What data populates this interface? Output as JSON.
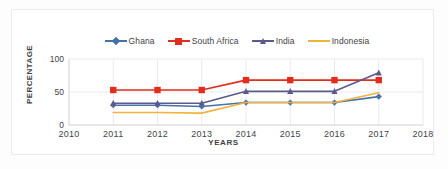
{
  "chart_data": {
    "type": "line",
    "title": "",
    "subtitle": "",
    "xlabel": "YEARS",
    "ylabel": "PERCENTAGE",
    "x": [
      2011,
      2012,
      2013,
      2014,
      2015,
      2016,
      2017
    ],
    "xlim": [
      2010,
      2018
    ],
    "ylim": [
      0,
      100
    ],
    "yticks": [
      0,
      50,
      100
    ],
    "xticks": [
      2010,
      2011,
      2012,
      2013,
      2014,
      2015,
      2016,
      2017,
      2018
    ],
    "grid": "horizontal-and-vertical-light",
    "legend_position": "top-center",
    "series": [
      {
        "name": "Ghana",
        "color": "#4472a8",
        "marker": "diamond",
        "values": [
          30,
          30,
          28,
          34,
          34,
          34,
          43
        ]
      },
      {
        "name": "South Africa",
        "color": "#e32d1c",
        "marker": "square",
        "values": [
          53,
          53,
          53,
          68,
          68,
          68,
          68
        ]
      },
      {
        "name": "India",
        "color": "#5a5a8c",
        "marker": "triangle",
        "values": [
          33,
          33,
          33,
          51,
          51,
          51,
          79
        ]
      },
      {
        "name": "Indonesia",
        "color": "#f2b33d",
        "marker": "none",
        "values": [
          19,
          19,
          18,
          34,
          34,
          34,
          49
        ]
      }
    ]
  },
  "axis": {
    "ytick_labels": [
      "100",
      "50",
      "0"
    ],
    "xtick_labels": [
      "2010",
      "2011",
      "2012",
      "2013",
      "2014",
      "2015",
      "2016",
      "2017",
      "2018"
    ],
    "ylabel": "PERCENTAGE",
    "xlabel": "YEARS"
  },
  "legend": {
    "entries": [
      {
        "label": "Ghana",
        "color": "#4472a8",
        "marker": "diamond"
      },
      {
        "label": "South Africa",
        "color": "#e32d1c",
        "marker": "square"
      },
      {
        "label": "India",
        "color": "#5a5a8c",
        "marker": "triangle"
      },
      {
        "label": "Indonesia",
        "color": "#f2b33d",
        "marker": "none"
      }
    ]
  },
  "colors": {
    "ghana": "#4472a8",
    "south_africa": "#e32d1c",
    "india": "#5a5a8c",
    "indonesia": "#f2b33d",
    "grid": "#e4e4ea",
    "axis_text": "#44444c",
    "background": "#ffffff"
  }
}
